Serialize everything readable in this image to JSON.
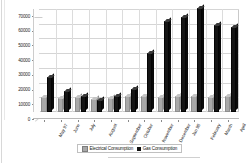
{
  "chart_data": {
    "type": "bar",
    "title": "",
    "subtitle": "",
    "xlabel": "",
    "ylabel": "",
    "ylim": [
      0,
      70000
    ],
    "yticks": [
      0,
      10000,
      20000,
      30000,
      40000,
      50000,
      60000,
      70000
    ],
    "ytick_labels": [
      "0",
      "10000",
      "20000",
      "30000",
      "40000",
      "50000",
      "60000",
      "70000"
    ],
    "grid": true,
    "legend_position": "bottom",
    "style": "3d-clustered-column",
    "categories": [
      "May 97",
      "June",
      "July",
      "August",
      "September",
      "October",
      "November",
      "December",
      "Jan 98",
      "February",
      "March",
      "April"
    ],
    "series": [
      {
        "name": "Electrical Consumption",
        "color": "#a8a8a8",
        "values": [
          10000,
          9800,
          10200,
          8800,
          9800,
          10600,
          10800,
          10400,
          10600,
          10600,
          10500,
          11000
        ]
      },
      {
        "name": "Gas Consumption",
        "color": "#111111",
        "values": [
          24000,
          14500,
          10800,
          8200,
          11000,
          15500,
          40000,
          62000,
          64500,
          71000,
          59000,
          58000
        ]
      }
    ],
    "note": "Second series April value is 40000; series are drawn as clustered pairs per month"
  },
  "legend": {
    "items": [
      {
        "label": "Electrical Consumption",
        "swatch": "elec"
      },
      {
        "label": "Gas Consumption",
        "swatch": "gas"
      }
    ]
  }
}
